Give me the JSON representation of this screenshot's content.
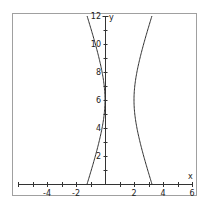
{
  "chart_data": {
    "type": "line",
    "title": "",
    "xlabel": "x",
    "ylabel": "y",
    "xlim": [
      -6,
      6
    ],
    "ylim": [
      0,
      12
    ],
    "grid": false,
    "x_tick_labels": [
      "-4",
      "-2",
      "2",
      "4",
      "6"
    ],
    "y_tick_labels": [
      "2",
      "4",
      "6",
      "8",
      "10",
      "12"
    ],
    "series": [
      {
        "name": "hyperbola (x-1)^2 - (y-6)^2/9 = 1",
        "equation": "(x-1)^2 - (y-6)^2/9 = 1",
        "center": [
          1,
          6
        ],
        "a": 1,
        "b": 3,
        "left_branch": {
          "vertex": [
            0,
            6
          ],
          "at_y0": -1.24,
          "at_y12": -1.24
        },
        "right_branch": {
          "vertex": [
            2,
            6
          ],
          "at_y0": 3.24,
          "at_y12": 3.24
        }
      }
    ]
  },
  "frame": {
    "left": 12,
    "top": 13,
    "right": 196,
    "bottom": 195
  },
  "axes": {
    "origin_px": [
      105,
      184
    ],
    "x_unit_px": 14.5,
    "y_unit_px": 14,
    "x_axis_start_px": 18,
    "x_axis_end_px": 192
  },
  "colors": {
    "frame": "#a0a0a0",
    "axis": "#333333",
    "curve": "#333333",
    "text": "#222222"
  }
}
